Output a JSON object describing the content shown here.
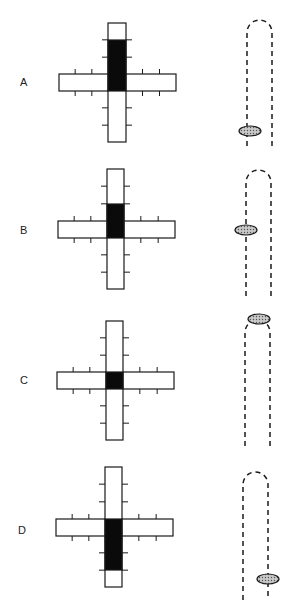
{
  "panels": [
    {
      "label": "A",
      "label_pos": [
        20,
        76
      ],
      "cross": {
        "vx": 108,
        "vy": 23,
        "vw": 18,
        "vh": 119,
        "hx": 59,
        "hy": 74,
        "hw": 117,
        "hh": 17,
        "black_y1": 40,
        "black_y2": 91
      },
      "tube": {
        "lx": 247,
        "rx": 272,
        "top": 20,
        "bottom": 146
      },
      "ellipse": {
        "cx": 250,
        "cy": 131
      },
      "ellipse_position": "bottom-left"
    },
    {
      "label": "B",
      "label_pos": [
        20,
        224
      ],
      "cross": {
        "vx": 107,
        "vy": 169,
        "vw": 17,
        "vh": 120,
        "hx": 58,
        "hy": 221,
        "hw": 117,
        "hh": 17,
        "black_y1": 204,
        "black_y2": 238
      },
      "tube": {
        "lx": 246,
        "rx": 271,
        "top": 170,
        "bottom": 296
      },
      "ellipse": {
        "cx": 246,
        "cy": 230
      },
      "ellipse_position": "middle-left"
    },
    {
      "label": "C",
      "label_pos": [
        20,
        374
      ],
      "cross": {
        "vx": 106,
        "vy": 321,
        "vw": 17,
        "vh": 119,
        "hx": 57,
        "hy": 372,
        "hw": 117,
        "hh": 17,
        "black_y1": 372,
        "black_y2": 389
      },
      "tube": {
        "lx": 245,
        "rx": 270,
        "top": 320,
        "bottom": 446
      },
      "ellipse": {
        "cx": 259,
        "cy": 319
      },
      "ellipse_position": "top"
    },
    {
      "label": "D",
      "label_pos": [
        18,
        524
      ],
      "cross": {
        "vx": 105,
        "vy": 467,
        "vw": 17,
        "vh": 120,
        "hx": 56,
        "hy": 519,
        "hw": 117,
        "hh": 17,
        "black_y1": 519,
        "black_y2": 570
      },
      "tube": {
        "lx": 243,
        "rx": 268,
        "top": 472,
        "bottom": 600
      },
      "ellipse": {
        "cx": 268,
        "cy": 579
      },
      "ellipse_position": "bottom-right"
    }
  ],
  "colors": {
    "stroke": "#1a1a1a",
    "fill_black": "#0a0a0a",
    "ellipse_fill": "#b0b0b0"
  }
}
